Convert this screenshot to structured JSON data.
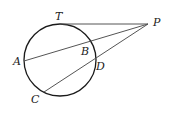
{
  "diagram": {
    "type": "geometry",
    "colors": {
      "circle": "#1a1a1a",
      "lines": "#555555",
      "labels": "#222222"
    },
    "circle": {
      "cx": 60,
      "cy": 60,
      "r": 36
    },
    "points": {
      "T": {
        "label": "T",
        "x": 60,
        "y": 24
      },
      "P": {
        "label": "P",
        "x": 148,
        "y": 24
      },
      "A": {
        "label": "A",
        "x": 24,
        "y": 61
      },
      "B": {
        "label": "B",
        "x": 88,
        "y": 42
      },
      "C": {
        "label": "C",
        "x": 44,
        "y": 92
      },
      "D": {
        "label": "D",
        "x": 95,
        "y": 60
      }
    },
    "segments": [
      {
        "name": "tangent-PT",
        "from": "P",
        "to": "T"
      },
      {
        "name": "secant-PA",
        "from": "P",
        "to": "A",
        "passes_through": "B"
      },
      {
        "name": "secant-PC",
        "from": "P",
        "to": "C",
        "passes_through": "D"
      }
    ]
  }
}
